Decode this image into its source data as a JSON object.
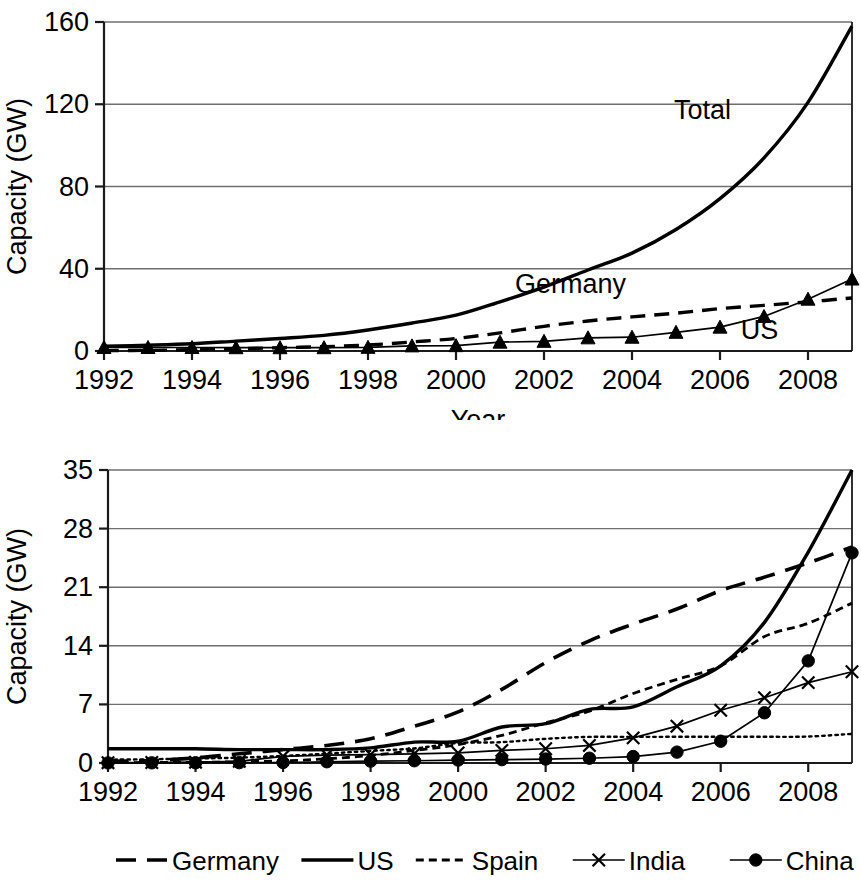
{
  "figure": {
    "background": "#ffffff",
    "ink_color": "#000000",
    "grid_color": "#6f6f6f"
  },
  "chart_data": [
    {
      "id": "top",
      "type": "line",
      "title": "",
      "xlabel": "Year",
      "ylabel": "Capacity (GW)",
      "xlim": [
        1992,
        2009
      ],
      "ylim": [
        0,
        160
      ],
      "yticks": [
        0,
        40,
        80,
        120,
        160
      ],
      "xticks": [
        1992,
        1994,
        1996,
        1998,
        2000,
        2002,
        2004,
        2006,
        2008
      ],
      "xtick_labels": [
        "1992",
        "1994",
        "1996",
        "1998",
        "2000",
        "2002",
        "2004",
        "2006",
        "2008"
      ],
      "ytick_labels": [
        "0",
        "40",
        "80",
        "120",
        "160"
      ],
      "grid": "horizontal",
      "legend": "inline-annotations",
      "x": [
        1992,
        1993,
        1994,
        1995,
        1996,
        1997,
        1998,
        1999,
        2000,
        2001,
        2002,
        2003,
        2004,
        2005,
        2006,
        2007,
        2008,
        2009
      ],
      "series": [
        {
          "name": "Total",
          "style": "solid",
          "marker": "none",
          "label_text": "Total",
          "label_x": 2005.6,
          "label_y": 113,
          "values": [
            2.3,
            2.8,
            3.5,
            4.8,
            6.1,
            7.6,
            10.2,
            13.6,
            17.4,
            23.9,
            31.1,
            39.4,
            47.6,
            59.1,
            74.1,
            93.9,
            120.9,
            158.0
          ]
        },
        {
          "name": "Germany",
          "style": "dashed",
          "marker": "none",
          "label_text": "Germany",
          "label_x": 2002.6,
          "label_y": 28,
          "values": [
            0.2,
            0.3,
            0.6,
            1.1,
            1.6,
            2.1,
            2.9,
            4.4,
            6.1,
            8.8,
            12.0,
            14.6,
            16.6,
            18.4,
            20.6,
            22.2,
            23.9,
            25.8
          ]
        },
        {
          "name": "US",
          "style": "solid-thin",
          "marker": "triangle",
          "label_text": "US",
          "label_x": 2006.9,
          "label_y": 6,
          "values": [
            1.7,
            1.7,
            1.7,
            1.6,
            1.6,
            1.6,
            1.8,
            2.5,
            2.6,
            4.3,
            4.7,
            6.4,
            6.7,
            9.1,
            11.6,
            16.8,
            25.2,
            35.0
          ]
        }
      ]
    },
    {
      "id": "bottom",
      "type": "line",
      "title": "",
      "xlabel": "Year",
      "ylabel": "Capacity (GW)",
      "xlim": [
        1992,
        2009
      ],
      "ylim": [
        0,
        35
      ],
      "yticks": [
        0,
        7,
        14,
        21,
        28,
        35
      ],
      "xticks": [
        1992,
        1994,
        1996,
        1998,
        2000,
        2002,
        2004,
        2006,
        2008
      ],
      "xtick_labels": [
        "1992",
        "1994",
        "1996",
        "1998",
        "2000",
        "2002",
        "2004",
        "2006",
        "2008"
      ],
      "ytick_labels": [
        "0",
        "7",
        "14",
        "21",
        "28",
        "35"
      ],
      "grid": "horizontal",
      "legend": "bottom",
      "x": [
        1992,
        1993,
        1994,
        1995,
        1996,
        1997,
        1998,
        1999,
        2000,
        2001,
        2002,
        2003,
        2004,
        2005,
        2006,
        2007,
        2008,
        2009
      ],
      "series": [
        {
          "name": "Germany",
          "style": "long-dash",
          "marker": "none",
          "values": [
            0.2,
            0.3,
            0.6,
            1.1,
            1.6,
            2.1,
            2.9,
            4.4,
            6.1,
            8.8,
            12.0,
            14.6,
            16.6,
            18.4,
            20.6,
            22.2,
            23.9,
            25.8
          ]
        },
        {
          "name": "US",
          "style": "solid",
          "marker": "none",
          "values": [
            1.7,
            1.7,
            1.7,
            1.6,
            1.6,
            1.6,
            1.8,
            2.5,
            2.6,
            4.3,
            4.7,
            6.4,
            6.7,
            9.1,
            11.6,
            16.8,
            25.2,
            35.0
          ]
        },
        {
          "name": "Spain",
          "style": "short-dash",
          "marker": "none",
          "values": [
            0.05,
            0.06,
            0.07,
            0.15,
            0.25,
            0.5,
            0.9,
            1.5,
            2.2,
            3.3,
            4.8,
            6.2,
            8.3,
            10.0,
            11.6,
            15.1,
            16.7,
            19.1
          ]
        },
        {
          "name": "India",
          "style": "solid-thin",
          "marker": "x",
          "values": [
            0.04,
            0.06,
            0.1,
            0.2,
            0.8,
            0.95,
            1.0,
            1.1,
            1.2,
            1.5,
            1.7,
            2.1,
            3.0,
            4.4,
            6.3,
            7.8,
            9.6,
            10.9
          ]
        },
        {
          "name": "China",
          "style": "solid-thin",
          "marker": "dot",
          "values": [
            0.01,
            0.02,
            0.03,
            0.04,
            0.06,
            0.15,
            0.22,
            0.27,
            0.35,
            0.4,
            0.47,
            0.57,
            0.77,
            1.3,
            2.6,
            6.0,
            12.2,
            25.1
          ]
        },
        {
          "name": "Denmark",
          "style": "dotted",
          "marker": "none",
          "values": [
            0.4,
            0.45,
            0.54,
            0.64,
            0.84,
            1.12,
            1.44,
            1.74,
            2.39,
            2.49,
            2.89,
            3.12,
            3.12,
            3.13,
            3.14,
            3.13,
            3.16,
            3.48
          ]
        }
      ]
    }
  ],
  "legend": {
    "items": [
      {
        "label": "Germany",
        "style": "long-dash",
        "marker": "none"
      },
      {
        "label": "US",
        "style": "solid",
        "marker": "none"
      },
      {
        "label": "Spain",
        "style": "short-dash",
        "marker": "none"
      },
      {
        "label": "India",
        "style": "solid-thin",
        "marker": "x"
      },
      {
        "label": "China",
        "style": "solid-thin",
        "marker": "dot"
      },
      {
        "label": "Denmark",
        "style": "dotted",
        "marker": "none"
      }
    ]
  }
}
